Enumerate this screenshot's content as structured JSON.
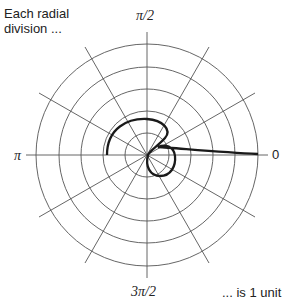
{
  "annotation_top": {
    "line1": "Each radial",
    "line2": "division ..."
  },
  "annotation_bottom": "... is 1 unit",
  "angle_labels": {
    "zero": "0",
    "half_pi": "π/2",
    "pi": "π",
    "three_half_pi": "3π/2"
  },
  "grid": {
    "rings": 5,
    "spoke_step_degrees": 30
  },
  "colors": {
    "grid": "#555555",
    "curve": "#1a1a1a"
  }
}
